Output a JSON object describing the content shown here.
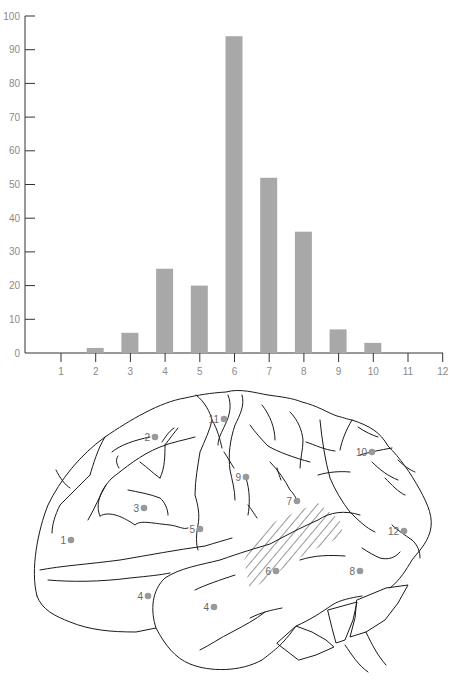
{
  "chart_data": {
    "type": "bar",
    "title": "",
    "xlabel": "",
    "ylabel": "",
    "categories": [
      "1",
      "2",
      "3",
      "4",
      "5",
      "6",
      "7",
      "8",
      "9",
      "10",
      "11",
      "12"
    ],
    "values": [
      0,
      1.5,
      6,
      25,
      20,
      94,
      52,
      36,
      7,
      3,
      0,
      0
    ],
    "ylim": [
      0,
      100
    ],
    "yticks": [
      "0",
      "10",
      "20",
      "30",
      "40",
      "50",
      "60",
      "70",
      "80",
      "90",
      "100"
    ],
    "xticks": [
      "1",
      "2",
      "3",
      "4",
      "5",
      "6",
      "7",
      "8",
      "9",
      "10",
      "11",
      "12"
    ],
    "grid": false,
    "legend": null,
    "bar_color": "#a8a8a8"
  },
  "diagram": {
    "type": "brain-lateral-view",
    "marker_color": "#999999",
    "markers": [
      {
        "label": "1",
        "x": 71,
        "y": 540
      },
      {
        "label": "2",
        "x": 155,
        "y": 437
      },
      {
        "label": "3",
        "x": 144,
        "y": 508
      },
      {
        "label": "4",
        "x": 148,
        "y": 596
      },
      {
        "label": "4",
        "x": 214,
        "y": 607
      },
      {
        "label": "5",
        "x": 200,
        "y": 529
      },
      {
        "label": "6",
        "x": 276,
        "y": 571
      },
      {
        "label": "7",
        "x": 297,
        "y": 501
      },
      {
        "label": "8",
        "x": 360,
        "y": 571
      },
      {
        "label": "9",
        "x": 246,
        "y": 477
      },
      {
        "label": "10",
        "x": 372,
        "y": 452
      },
      {
        "label": "11",
        "x": 224,
        "y": 419
      },
      {
        "label": "12",
        "x": 404,
        "y": 531
      }
    ]
  }
}
